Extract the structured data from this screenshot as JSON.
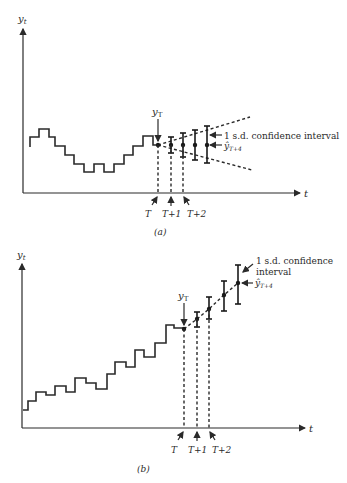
{
  "figure": {
    "panels": [
      {
        "id": "a",
        "caption": "(a)",
        "y_axis_label": "y_t",
        "x_axis_label": "t",
        "observed_label": "y_T",
        "interval_label": "1 s.d. confidence interval",
        "forecast_label": "ŷ_{T+4}",
        "tick_labels": [
          "T",
          "T+1",
          "T+2"
        ],
        "axis": {
          "x0": 23,
          "y_top": 28,
          "y_base": 193,
          "x_end": 300
        },
        "series": [
          [
            30,
            147
          ],
          [
            30,
            137
          ],
          [
            39,
            137
          ],
          [
            39,
            129
          ],
          [
            49,
            129
          ],
          [
            49,
            137
          ],
          [
            55,
            137
          ],
          [
            55,
            146
          ],
          [
            65,
            146
          ],
          [
            65,
            155
          ],
          [
            74,
            155
          ],
          [
            74,
            164
          ],
          [
            84,
            164
          ],
          [
            84,
            172
          ],
          [
            94,
            172
          ],
          [
            94,
            164
          ],
          [
            104,
            164
          ],
          [
            104,
            172
          ],
          [
            114,
            172
          ],
          [
            114,
            164
          ],
          [
            124,
            164
          ],
          [
            124,
            155
          ],
          [
            133,
            155
          ],
          [
            133,
            146
          ],
          [
            143,
            146
          ],
          [
            143,
            136
          ],
          [
            153,
            136
          ],
          [
            153,
            145
          ],
          [
            158,
            145
          ]
        ],
        "origin": [
          158,
          145
        ],
        "forecasts": [
          {
            "x": 171,
            "y": 145,
            "lo": 153,
            "hi": 137
          },
          {
            "x": 183,
            "y": 145,
            "lo": 157,
            "hi": 133
          },
          {
            "x": 195,
            "y": 145,
            "lo": 160,
            "hi": 130
          },
          {
            "x": 207,
            "y": 145,
            "lo": 163,
            "hi": 126
          }
        ],
        "cone": {
          "upper_end": [
            250,
            117
          ],
          "lower_end": [
            252,
            170
          ]
        },
        "tick_x": [
          158,
          171,
          183
        ]
      },
      {
        "id": "b",
        "caption": "(b)",
        "y_axis_label": "y_t",
        "x_axis_label": "t",
        "observed_label": "y_T",
        "interval_label_line1": "1 s.d. confidence",
        "interval_label_line2": "interval",
        "forecast_label": "ŷ_{T+4}",
        "tick_labels": [
          "T",
          "T+1",
          "T+2"
        ],
        "axis": {
          "x0": 22,
          "y_top": 266,
          "y_base": 428,
          "x_end": 305
        },
        "series": [
          [
            23,
            410
          ],
          [
            28,
            410
          ],
          [
            28,
            401
          ],
          [
            36,
            401
          ],
          [
            36,
            392
          ],
          [
            46,
            392
          ],
          [
            46,
            395
          ],
          [
            55,
            395
          ],
          [
            55,
            386
          ],
          [
            66,
            386
          ],
          [
            66,
            392
          ],
          [
            75,
            392
          ],
          [
            75,
            378
          ],
          [
            86,
            378
          ],
          [
            86,
            383
          ],
          [
            96,
            383
          ],
          [
            96,
            389
          ],
          [
            107,
            389
          ],
          [
            107,
            374
          ],
          [
            115,
            374
          ],
          [
            115,
            362
          ],
          [
            126,
            362
          ],
          [
            126,
            367
          ],
          [
            135,
            367
          ],
          [
            135,
            350
          ],
          [
            144,
            350
          ],
          [
            144,
            357
          ],
          [
            155,
            357
          ],
          [
            155,
            343
          ],
          [
            166,
            343
          ],
          [
            166,
            325
          ],
          [
            174,
            325
          ],
          [
            174,
            328
          ],
          [
            184,
            328
          ]
        ],
        "origin": [
          184,
          329
        ],
        "forecasts": [
          {
            "x": 197,
            "y": 319,
            "lo": 327,
            "hi": 312
          },
          {
            "x": 209,
            "y": 309,
            "lo": 319,
            "hi": 297
          },
          {
            "x": 224,
            "y": 295,
            "lo": 311,
            "hi": 281
          },
          {
            "x": 238,
            "y": 283,
            "lo": 304,
            "hi": 265
          }
        ],
        "tick_x": [
          184,
          197,
          209
        ]
      }
    ]
  }
}
